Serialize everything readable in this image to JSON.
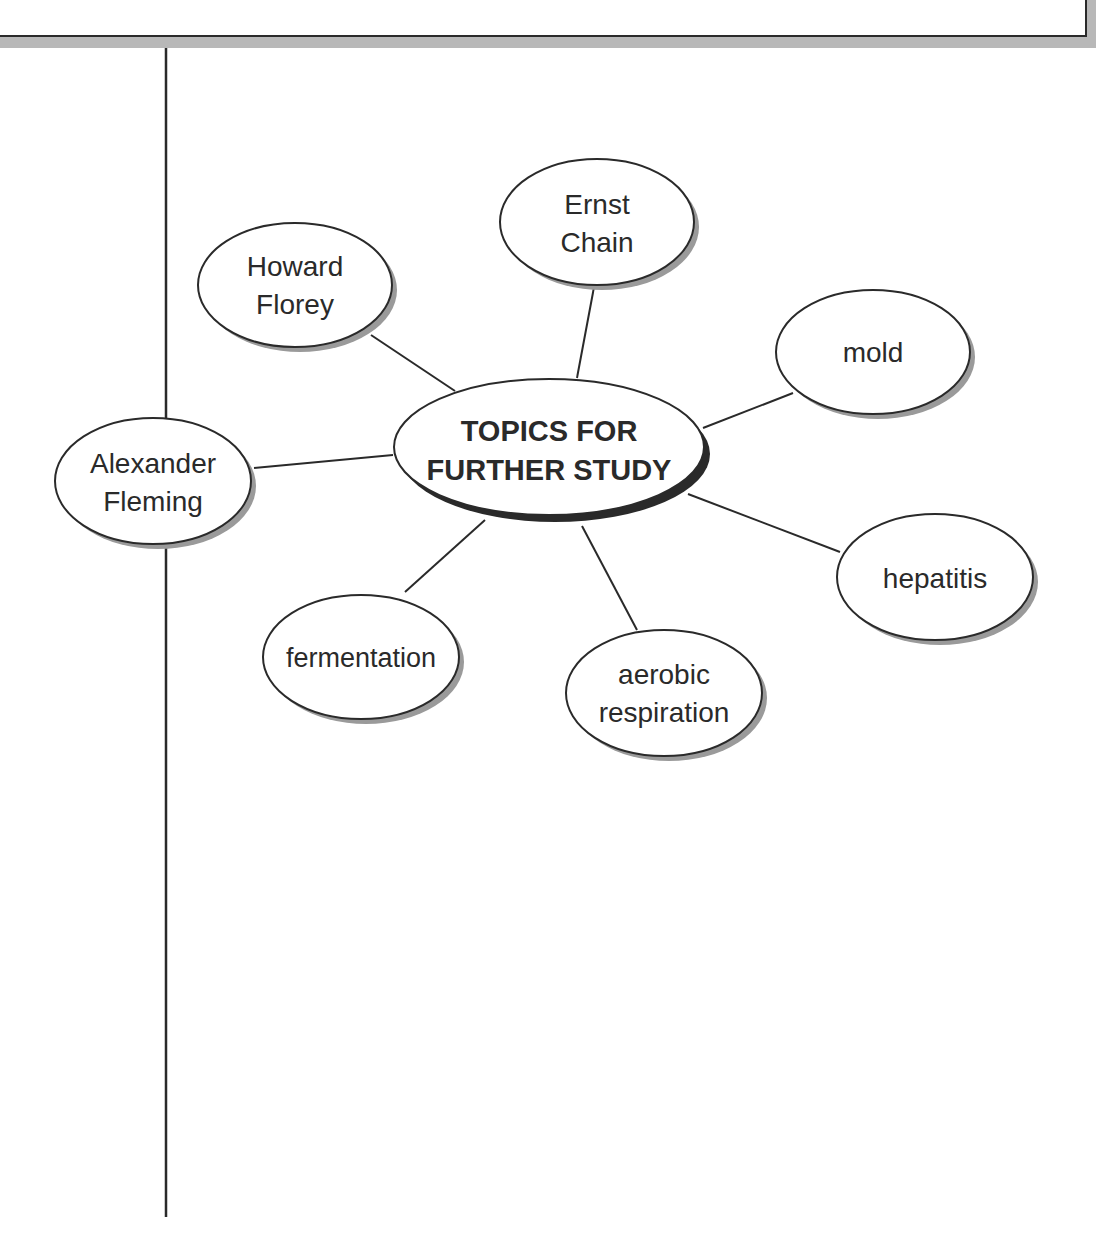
{
  "diagram": {
    "type": "concept-web",
    "central": {
      "label_line1": "TOPICS FOR",
      "label_line2": "FURTHER STUDY",
      "cx": 549,
      "cy": 447,
      "rx": 155,
      "ry": 68
    },
    "nodes": [
      {
        "id": "howard-florey",
        "line1": "Howard",
        "line2": "Florey",
        "cx": 295,
        "cy": 285
      },
      {
        "id": "ernst-chain",
        "line1": "Ernst",
        "line2": "Chain",
        "cx": 597,
        "cy": 222
      },
      {
        "id": "mold",
        "line1": "mold",
        "line2": "",
        "cx": 873,
        "cy": 352
      },
      {
        "id": "alexander-fleming",
        "line1": "Alexander",
        "line2": "Fleming",
        "cx": 153,
        "cy": 481
      },
      {
        "id": "hepatitis",
        "line1": "hepatitis",
        "line2": "",
        "cx": 935,
        "cy": 577
      },
      {
        "id": "fermentation",
        "line1": "fermentation",
        "line2": "",
        "cx": 361,
        "cy": 657
      },
      {
        "id": "aerobic-respiration",
        "line1": "aerobic",
        "line2": "respiration",
        "cx": 664,
        "cy": 693
      }
    ],
    "colors": {
      "stroke": "#2a2a2a",
      "shadow": "#9a9a9a",
      "central_shadow": "#2a2a2a",
      "fill": "#ffffff",
      "box_shadow": "#b8b8b8"
    }
  }
}
